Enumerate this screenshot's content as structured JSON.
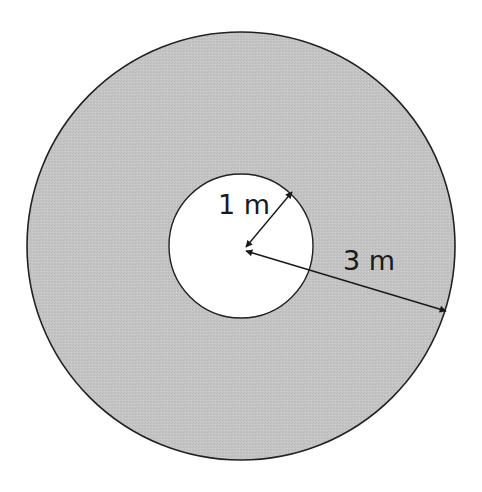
{
  "diagram": {
    "type": "annulus",
    "outer_circle": {
      "cx": 241,
      "cy": 246,
      "r": 214,
      "fill": "#c4c4c4",
      "stroke": "#222222"
    },
    "inner_circle": {
      "cx": 241,
      "cy": 246,
      "r": 72,
      "fill": "#ffffff",
      "stroke": "#222222"
    },
    "labels": {
      "inner_radius": "1 m",
      "outer_radius": "3 m"
    },
    "arrows": {
      "inner_radius": {
        "from": [
          244,
          250
        ],
        "to": [
          294,
          190
        ]
      },
      "outer_radius": {
        "from": [
          244,
          250
        ],
        "to": [
          447,
          311
        ]
      }
    }
  }
}
